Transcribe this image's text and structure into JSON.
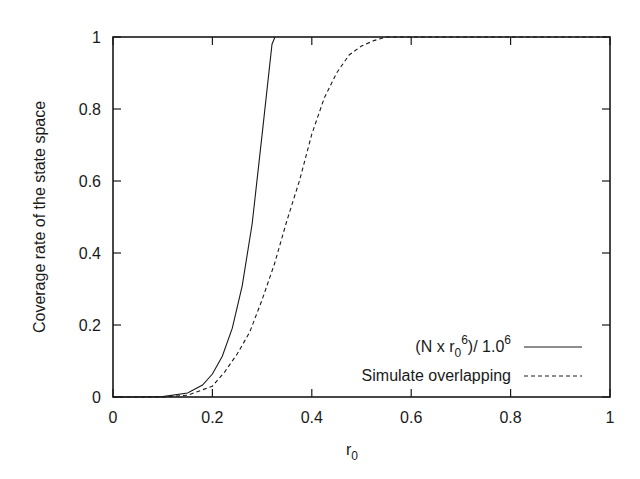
{
  "chart_data": {
    "type": "line",
    "title": "",
    "xlabel": "r_0",
    "ylabel": "Coverage rate of the state space",
    "xlim": [
      0,
      1
    ],
    "ylim": [
      0,
      1
    ],
    "xticks": [
      "0",
      "0.2",
      "0.4",
      "0.6",
      "0.8",
      "1"
    ],
    "yticks": [
      "0",
      "0.2",
      "0.4",
      "0.6",
      "0.8",
      "1"
    ],
    "grid": false,
    "legend_position": "lower right",
    "series": [
      {
        "name": "(N x r0^6)/ 1.0^6",
        "style": "solid",
        "x": [
          0.0,
          0.05,
          0.1,
          0.15,
          0.18,
          0.2,
          0.22,
          0.24,
          0.26,
          0.28,
          0.3,
          0.32,
          0.326
        ],
        "y": [
          0.0,
          0.0,
          0.001,
          0.011,
          0.033,
          0.064,
          0.113,
          0.191,
          0.309,
          0.482,
          0.729,
          0.98,
          1.0
        ]
      },
      {
        "name": "Simulate overlapping",
        "style": "dashed",
        "x": [
          0.0,
          0.1,
          0.15,
          0.2,
          0.225,
          0.25,
          0.275,
          0.3,
          0.325,
          0.35,
          0.375,
          0.4,
          0.425,
          0.45,
          0.475,
          0.5,
          0.525,
          0.55,
          0.6,
          0.8,
          1.0
        ],
        "y": [
          0.0,
          0.0,
          0.005,
          0.03,
          0.07,
          0.12,
          0.18,
          0.27,
          0.37,
          0.49,
          0.6,
          0.73,
          0.83,
          0.9,
          0.95,
          0.975,
          0.99,
          1.0,
          1.0,
          1.0,
          1.0
        ]
      }
    ]
  },
  "labels": {
    "xlabel_main": "r",
    "xlabel_sub": "0",
    "ylabel": "Coverage rate of the state space",
    "legend_1_pre": "(N x r",
    "legend_1_sub": "0",
    "legend_1_sup": "6",
    "legend_1_mid": ")/ 1.0",
    "legend_1_sup2": "6",
    "legend_2": "Simulate overlapping"
  },
  "ticks": {
    "x": [
      "0",
      "0.2",
      "0.4",
      "0.6",
      "0.8",
      "1"
    ],
    "y": [
      "0",
      "0.2",
      "0.4",
      "0.6",
      "0.8",
      "1"
    ]
  }
}
